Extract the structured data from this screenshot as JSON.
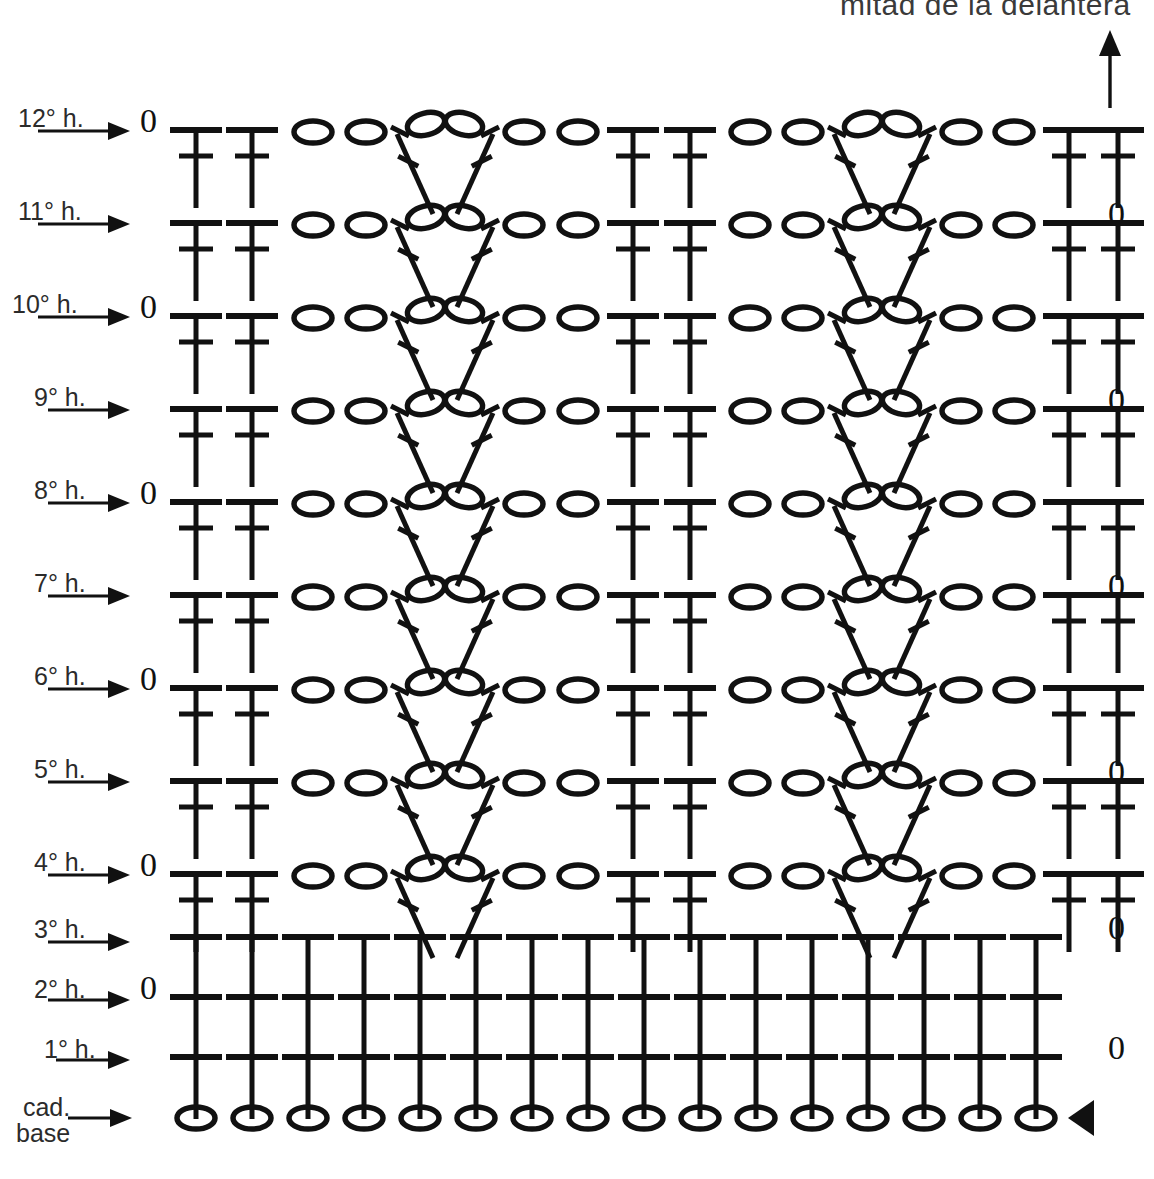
{
  "heading": {
    "text": "mitad de la delantera",
    "x": 840,
    "y": -12,
    "clipped": true
  },
  "direction_arrow": {
    "name": "upward-direction-arrow",
    "x": 1110,
    "y_top": 30,
    "y_bottom": 108
  },
  "legend_symbols": {
    "chain": "o",
    "treble": "T-with-crossbar",
    "double_crochet": "T",
    "turning_chain_marker": "0",
    "start_marker": "solid-left-triangle"
  },
  "colors": {
    "ink": "#111111",
    "label_ink": "#2b2b2b",
    "heading_ink": "#3a3a3a",
    "paper": "#ffffff"
  },
  "geometry": {
    "left_edge_x": 152,
    "right_edge_x": 1120,
    "row_pitch": 93,
    "base_row_y": 1118,
    "col_pitch": 56,
    "first_col_x": 196
  },
  "rows": [
    {
      "id": "row-12",
      "label": "12° h.",
      "label_x": 18,
      "label_y": 104,
      "arrow_x1": 38,
      "arrow_x2": 130,
      "arrow_y": 131,
      "baseline_y": 130,
      "zero_side": "left",
      "zero_x": 140,
      "pattern": "lace",
      "stitch_type": "treble"
    },
    {
      "id": "row-11",
      "label": "11° h.",
      "label_x": 18,
      "label_y": 197,
      "arrow_x1": 38,
      "arrow_x2": 130,
      "arrow_y": 224,
      "baseline_y": 223,
      "zero_side": "right",
      "zero_x": 1108,
      "pattern": "lace",
      "stitch_type": "treble"
    },
    {
      "id": "row-10",
      "label": "10° h.",
      "label_x": 12,
      "label_y": 290,
      "arrow_x1": 38,
      "arrow_x2": 130,
      "arrow_y": 317,
      "baseline_y": 316,
      "zero_side": "left",
      "zero_x": 140,
      "pattern": "lace",
      "stitch_type": "treble"
    },
    {
      "id": "row-9",
      "label": "9° h.",
      "label_x": 34,
      "label_y": 383,
      "arrow_x1": 48,
      "arrow_x2": 130,
      "arrow_y": 410,
      "baseline_y": 409,
      "zero_side": "right",
      "zero_x": 1108,
      "pattern": "lace",
      "stitch_type": "treble"
    },
    {
      "id": "row-8",
      "label": "8° h.",
      "label_x": 34,
      "label_y": 476,
      "arrow_x1": 48,
      "arrow_x2": 130,
      "arrow_y": 503,
      "baseline_y": 502,
      "zero_side": "left",
      "zero_x": 140,
      "pattern": "lace",
      "stitch_type": "treble"
    },
    {
      "id": "row-7",
      "label": "7° h.",
      "label_x": 34,
      "label_y": 569,
      "arrow_x1": 48,
      "arrow_x2": 130,
      "arrow_y": 596,
      "baseline_y": 595,
      "zero_side": "right",
      "zero_x": 1108,
      "pattern": "lace",
      "stitch_type": "treble"
    },
    {
      "id": "row-6",
      "label": "6° h.",
      "label_x": 34,
      "label_y": 662,
      "arrow_x1": 48,
      "arrow_x2": 130,
      "arrow_y": 689,
      "baseline_y": 688,
      "zero_side": "left",
      "zero_x": 140,
      "pattern": "lace",
      "stitch_type": "treble"
    },
    {
      "id": "row-5",
      "label": "5° h.",
      "label_x": 34,
      "label_y": 755,
      "arrow_x1": 48,
      "arrow_x2": 130,
      "arrow_y": 782,
      "baseline_y": 781,
      "zero_side": "right",
      "zero_x": 1108,
      "pattern": "lace",
      "stitch_type": "treble"
    },
    {
      "id": "row-4",
      "label": "4° h.",
      "label_x": 34,
      "label_y": 848,
      "arrow_x1": 48,
      "arrow_x2": 130,
      "arrow_y": 875,
      "baseline_y": 874,
      "zero_side": "left",
      "zero_x": 140,
      "pattern": "lace",
      "stitch_type": "treble"
    },
    {
      "id": "row-3",
      "label": "3° h.",
      "label_x": 34,
      "label_y": 915,
      "arrow_x1": 48,
      "arrow_x2": 130,
      "arrow_y": 942,
      "baseline_y": 937,
      "zero_side": "right",
      "zero_x": 1108,
      "pattern": "solid",
      "stitch_type": "double"
    },
    {
      "id": "row-2",
      "label": "2° h.",
      "label_x": 34,
      "label_y": 975,
      "arrow_x1": 48,
      "arrow_x2": 130,
      "arrow_y": 1000,
      "baseline_y": 997,
      "zero_side": "left",
      "zero_x": 140,
      "pattern": "solid",
      "stitch_type": "double"
    },
    {
      "id": "row-1",
      "label": "1° h.",
      "label_x": 44,
      "label_y": 1035,
      "arrow_x1": 56,
      "arrow_x2": 130,
      "arrow_y": 1060,
      "baseline_y": 1057,
      "zero_side": "right",
      "zero_x": 1108,
      "pattern": "solid",
      "stitch_type": "double"
    },
    {
      "id": "row-base",
      "label": "cad.",
      "label2": "base",
      "label_x": 16,
      "label_y": 1095,
      "arrow_x1": 68,
      "arrow_x2": 132,
      "arrow_y": 1118,
      "baseline_y": 1118,
      "zero_side": "none",
      "pattern": "chain",
      "stitch_type": "chain",
      "end_marker": "triangle"
    }
  ],
  "lace_row_units": [
    {
      "kind": "treble",
      "x": 196
    },
    {
      "kind": "treble",
      "x": 252
    },
    {
      "kind": "chain",
      "x": 313
    },
    {
      "kind": "chain",
      "x": 366
    },
    {
      "kind": "vcluster",
      "x": 445
    },
    {
      "kind": "chain",
      "x": 524
    },
    {
      "kind": "chain",
      "x": 578
    },
    {
      "kind": "treble",
      "x": 633
    },
    {
      "kind": "treble",
      "x": 690
    },
    {
      "kind": "chain",
      "x": 750
    },
    {
      "kind": "chain",
      "x": 803
    },
    {
      "kind": "vcluster",
      "x": 882
    },
    {
      "kind": "chain",
      "x": 961
    },
    {
      "kind": "chain",
      "x": 1014
    },
    {
      "kind": "treble",
      "x": 1069
    },
    {
      "kind": "treble",
      "x": 1118
    }
  ],
  "solid_row_columns": [
    196,
    252,
    308,
    364,
    420,
    476,
    532,
    588,
    644,
    700,
    756,
    812,
    868,
    924,
    980,
    1036
  ],
  "chain_row_columns": [
    196,
    252,
    308,
    364,
    420,
    476,
    532,
    588,
    644,
    700,
    756,
    812,
    868,
    924,
    980,
    1036
  ],
  "counts": {
    "total_rows": 13,
    "pattern_rows": 9,
    "plain_rows": 3,
    "base_chain_stitches": 16,
    "stitches_per_solid_row": 16,
    "lace_units_per_row": 16
  },
  "stitch_metrics": {
    "treble_stem_height": 78,
    "treble_top_bar_half": 26,
    "treble_cross_bar_half": 17,
    "treble_cross_offset": 26,
    "double_stem_height": 62,
    "double_top_bar_half": 26,
    "chain_rx": 19,
    "chain_ry": 11,
    "vcluster_half_spread": 34,
    "vcluster_leg_len": 84
  }
}
